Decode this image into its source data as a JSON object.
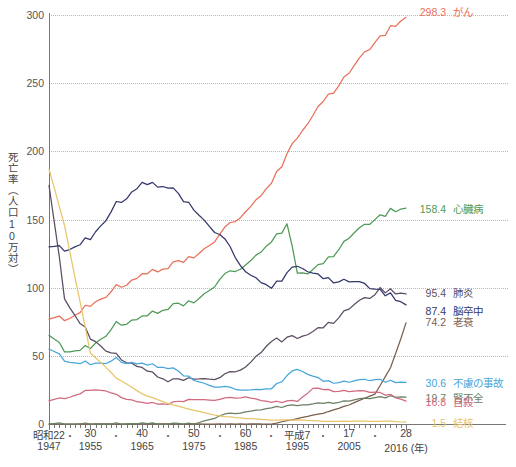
{
  "chart_data": {
    "type": "line",
    "title": "",
    "xlabel": "年",
    "ylabel": "死亡率（人口10万対）",
    "ylim": [
      0,
      300
    ],
    "yticks": [
      0,
      50,
      100,
      150,
      200,
      250,
      300
    ],
    "ytick_labels": [
      "0",
      "50",
      "100",
      "150",
      "200",
      "250",
      "300"
    ],
    "grid": "horizontal-dotted",
    "legend_position": "right-inline-end-of-line",
    "xlim": [
      1947,
      2016
    ],
    "x_tick_step": 1,
    "x_major_ticks": [
      {
        "era": "昭和22",
        "year": "1947",
        "value": 1947
      },
      {
        "era": "30",
        "year": "1955",
        "value": 1955
      },
      {
        "era": "40",
        "year": "1965",
        "value": 1965
      },
      {
        "era": "50",
        "year": "1975",
        "value": 1975
      },
      {
        "era": "60",
        "year": "1985",
        "value": 1985
      },
      {
        "era": "平成7",
        "year": "1995",
        "value": 1995
      },
      {
        "era": "17",
        "year": "2005",
        "value": 2005
      },
      {
        "era": "28",
        "year": "2016 (年)",
        "value": 2016
      }
    ],
    "x_dot_separators": [
      1951,
      1960,
      1970,
      1980,
      1990,
      2000,
      2010
    ],
    "series": [
      {
        "name": "がん",
        "end_label": "298.3",
        "color": "#e8705a",
        "x": [
          1947,
          1950,
          1955,
          1960,
          1965,
          1970,
          1975,
          1980,
          1985,
          1990,
          1995,
          2000,
          2005,
          2010,
          2013,
          2016
        ],
        "values": [
          77,
          77,
          87,
          100,
          108,
          116,
          122,
          139,
          156,
          177,
          211,
          236,
          258,
          279,
          290,
          298.3
        ]
      },
      {
        "name": "心臓病",
        "end_label": "158.4",
        "color": "#4f9a56",
        "x": [
          1947,
          1950,
          1955,
          1960,
          1965,
          1970,
          1975,
          1980,
          1985,
          1990,
          1993,
          1995,
          1997,
          2000,
          2005,
          2010,
          2013,
          2016
        ],
        "values": [
          65,
          54,
          56,
          73,
          77,
          86,
          89,
          106,
          117,
          134,
          146,
          112,
          111,
          117,
          137,
          149,
          156,
          158.4
        ]
      },
      {
        "name": "肺炎",
        "end_label": "95.4",
        "color": "#5b4d63",
        "x": [
          1947,
          1950,
          1955,
          1960,
          1965,
          1970,
          1975,
          1980,
          1985,
          1990,
          1995,
          2000,
          2005,
          2010,
          2011,
          2013,
          2016
        ],
        "values": [
          175,
          93,
          63,
          50,
          40,
          32,
          33,
          34,
          42,
          61,
          64,
          70,
          85,
          94,
          98,
          97,
          95.4
        ]
      },
      {
        "name": "脳卒中",
        "end_label": "87.4",
        "color": "#33376b",
        "x": [
          1947,
          1950,
          1955,
          1960,
          1965,
          1970,
          1975,
          1980,
          1985,
          1990,
          1995,
          2000,
          2005,
          2010,
          2013,
          2016
        ],
        "values": [
          130,
          128,
          136,
          161,
          175,
          175,
          157,
          139,
          112,
          100,
          117,
          106,
          105,
          98,
          94,
          87.4
        ]
      },
      {
        "name": "老衰",
        "end_label": "74.2",
        "color": "#7b5e4c",
        "x": [
          1947,
          1950,
          1955,
          1960,
          1965,
          1970,
          1975,
          1980,
          1985,
          1990,
          1995,
          2000,
          2005,
          2010,
          2013,
          2016
        ],
        "values": [
          0,
          0,
          0,
          0,
          0,
          0,
          0,
          0,
          0,
          0,
          4,
          8,
          14,
          22,
          41,
          74.2
        ]
      },
      {
        "name": "不慮の事故",
        "end_label": "30.6",
        "color": "#46a5d9",
        "x": [
          1947,
          1950,
          1955,
          1960,
          1965,
          1970,
          1975,
          1980,
          1985,
          1990,
          1995,
          2000,
          2005,
          2010,
          2013,
          2016
        ],
        "values": [
          55,
          47,
          44,
          47,
          43,
          42,
          32,
          27,
          25,
          26,
          41,
          31,
          31,
          32,
          31,
          30.6
        ]
      },
      {
        "name": "腎不全",
        "end_label": "19.7",
        "color": "#6b7f63",
        "x": [
          1947,
          1950,
          1955,
          1960,
          1965,
          1970,
          1975,
          1980,
          1985,
          1990,
          1995,
          2000,
          2005,
          2010,
          2013,
          2016
        ],
        "values": [
          0,
          0,
          0,
          0,
          0,
          0,
          0,
          6,
          9,
          12,
          14,
          15,
          17,
          19,
          20,
          19.7
        ]
      },
      {
        "name": "自殺",
        "end_label": "16.8",
        "color": "#d06a7e",
        "x": [
          1947,
          1950,
          1955,
          1958,
          1960,
          1965,
          1970,
          1975,
          1980,
          1985,
          1990,
          1995,
          1998,
          2000,
          2005,
          2010,
          2013,
          2016
        ],
        "values": [
          17,
          19,
          25,
          25,
          21,
          15,
          15,
          18,
          18,
          20,
          16,
          17,
          26,
          25,
          24,
          23,
          21,
          16.8
        ]
      },
      {
        "name": "結核",
        "end_label": "1.5",
        "color": "#e8c56a",
        "x": [
          1947,
          1950,
          1955,
          1960,
          1965,
          1970,
          1975,
          1980,
          1985,
          1990,
          1995,
          2000,
          2005,
          2010,
          2013,
          2016
        ],
        "values": [
          187,
          146,
          52,
          34,
          22,
          15,
          10,
          6,
          4,
          3,
          3,
          2,
          2,
          2,
          2,
          1.5
        ]
      }
    ]
  },
  "axis": {
    "y_title": "死亡率（人口10万対）"
  },
  "caption": ""
}
